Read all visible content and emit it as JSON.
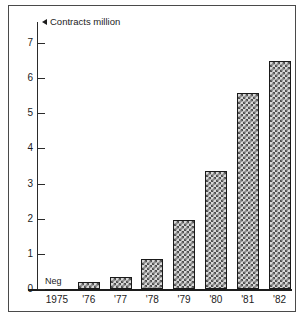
{
  "chart_data": {
    "type": "bar",
    "title": "",
    "subtitle": "",
    "xlabel": "",
    "ylabel": "Contracts million",
    "ylabel_marker": "left-triangle",
    "categories": [
      "1975",
      "'76",
      "'77",
      "'78",
      "'79",
      "'80",
      "'81",
      "'82"
    ],
    "values": [
      0,
      0.2,
      0.35,
      0.85,
      1.97,
      3.35,
      5.57,
      6.5
    ],
    "ylim": [
      0,
      7
    ],
    "ytick_labels": [
      "0",
      "1",
      "2",
      "3",
      "4",
      "5",
      "6",
      "7"
    ],
    "ytick_values": [
      0,
      1,
      2,
      3,
      4,
      5,
      6,
      7
    ],
    "grid": false,
    "legend": "none",
    "annotations": [
      {
        "text": "Neg",
        "category": "1975",
        "note": "negligible value, no bar drawn"
      }
    ],
    "bar_style": {
      "fill": "crosshatch",
      "fill_color": "#d8d8d8",
      "hatch_color": "#4f4f4f",
      "edge_color": "#1a1a1a"
    }
  },
  "frame": {
    "border_color": "#4a4a4a",
    "background": "#ffffff"
  },
  "axis": {
    "line_color": "#2b2b2b",
    "text_color": "#1c1c1c"
  }
}
